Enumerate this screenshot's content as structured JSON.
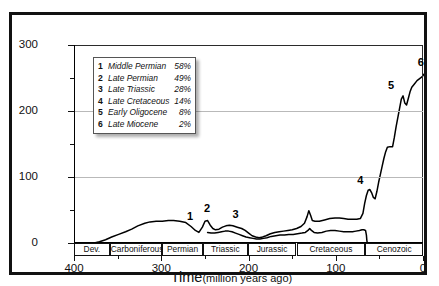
{
  "chart_data": {
    "type": "line",
    "title": "",
    "xlabel": "Time (million years ago)",
    "xlabel_main": "Time",
    "xlabel_sub": "(million years ago)",
    "ylabel": "Number of families",
    "xlim": [
      400,
      0
    ],
    "x_reversed": true,
    "ylim": [
      0,
      300
    ],
    "yticks": [
      0,
      100,
      200,
      300
    ],
    "yticks_minor": [
      50,
      150,
      250
    ],
    "xticks": [
      400,
      300,
      200,
      100,
      0
    ],
    "xticks_minor": [
      350,
      250,
      150,
      50
    ],
    "grid": "horizontal",
    "legend_position": "upper-left-inside",
    "series": [
      {
        "name": "Total families",
        "points": [
          [
            378,
            0
          ],
          [
            372,
            2
          ],
          [
            365,
            5
          ],
          [
            358,
            9
          ],
          [
            350,
            13
          ],
          [
            342,
            17
          ],
          [
            335,
            21
          ],
          [
            328,
            26
          ],
          [
            320,
            30
          ],
          [
            314,
            32
          ],
          [
            307,
            33
          ],
          [
            300,
            33
          ],
          [
            293,
            34
          ],
          [
            287,
            34
          ],
          [
            280,
            33
          ],
          [
            273,
            31
          ],
          [
            267,
            25
          ],
          [
            262,
            19
          ],
          [
            258,
            16
          ],
          [
            254,
            24
          ],
          [
            251,
            33
          ],
          [
            248,
            34
          ],
          [
            245,
            27
          ],
          [
            242,
            22
          ],
          [
            239,
            20
          ],
          [
            235,
            21
          ],
          [
            231,
            24
          ],
          [
            227,
            26
          ],
          [
            223,
            27
          ],
          [
            219,
            26
          ],
          [
            214,
            24
          ],
          [
            209,
            22
          ],
          [
            205,
            19
          ],
          [
            201,
            15
          ],
          [
            197,
            11
          ],
          [
            193,
            9
          ],
          [
            189,
            8
          ],
          [
            185,
            9
          ],
          [
            181,
            11
          ],
          [
            176,
            14
          ],
          [
            171,
            16
          ],
          [
            166,
            17
          ],
          [
            161,
            18
          ],
          [
            156,
            19
          ],
          [
            151,
            20
          ],
          [
            146,
            22
          ],
          [
            141,
            25
          ],
          [
            137,
            30
          ],
          [
            134,
            40
          ],
          [
            132,
            49
          ],
          [
            130,
            42
          ],
          [
            128,
            34
          ],
          [
            125,
            33
          ],
          [
            120,
            33
          ],
          [
            114,
            35
          ],
          [
            108,
            37
          ],
          [
            102,
            38
          ],
          [
            97,
            38
          ],
          [
            92,
            37
          ],
          [
            87,
            36
          ],
          [
            82,
            36
          ],
          [
            77,
            36
          ],
          [
            73,
            37
          ],
          [
            70,
            45
          ],
          [
            68,
            60
          ],
          [
            66,
            72
          ],
          [
            64,
            80
          ],
          [
            62,
            81
          ],
          [
            60,
            76
          ],
          [
            58,
            69
          ],
          [
            56,
            67
          ],
          [
            54,
            78
          ],
          [
            52,
            92
          ],
          [
            50,
            104
          ],
          [
            48,
            116
          ],
          [
            46,
            128
          ],
          [
            44,
            138
          ],
          [
            42,
            145
          ],
          [
            39,
            146
          ],
          [
            36,
            146
          ],
          [
            34,
            160
          ],
          [
            32,
            176
          ],
          [
            30,
            190
          ],
          [
            28,
            204
          ],
          [
            26,
            218
          ],
          [
            24,
            223
          ],
          [
            22,
            212
          ],
          [
            20,
            209
          ],
          [
            18,
            219
          ],
          [
            16,
            229
          ],
          [
            14,
            236
          ],
          [
            11,
            241
          ],
          [
            8,
            246
          ],
          [
            5,
            249
          ],
          [
            2,
            252
          ],
          [
            0,
            256
          ]
        ]
      },
      {
        "name": "Lower curve",
        "points": [
          [
            248,
            16
          ],
          [
            244,
            15
          ],
          [
            240,
            15
          ],
          [
            236,
            16
          ],
          [
            232,
            17
          ],
          [
            228,
            18
          ],
          [
            224,
            18
          ],
          [
            220,
            17
          ],
          [
            216,
            15
          ],
          [
            212,
            13
          ],
          [
            208,
            11
          ],
          [
            204,
            9
          ],
          [
            200,
            8
          ],
          [
            196,
            7
          ],
          [
            192,
            6
          ],
          [
            188,
            6
          ],
          [
            184,
            7
          ],
          [
            180,
            8
          ],
          [
            175,
            10
          ],
          [
            170,
            11
          ],
          [
            165,
            12
          ],
          [
            160,
            12
          ],
          [
            155,
            13
          ],
          [
            150,
            13
          ],
          [
            145,
            14
          ],
          [
            140,
            15
          ],
          [
            136,
            16
          ],
          [
            133,
            19
          ],
          [
            131,
            22
          ],
          [
            129,
            19
          ],
          [
            126,
            16
          ],
          [
            122,
            15
          ],
          [
            117,
            16
          ],
          [
            112,
            18
          ],
          [
            107,
            19
          ],
          [
            102,
            19
          ],
          [
            97,
            18
          ],
          [
            92,
            17
          ],
          [
            87,
            17
          ],
          [
            82,
            17
          ],
          [
            78,
            18
          ],
          [
            74,
            19
          ],
          [
            71,
            20
          ],
          [
            69,
            20
          ],
          [
            67,
            19
          ],
          [
            66,
            12
          ],
          [
            65.5,
            4
          ],
          [
            65,
            0
          ]
        ]
      }
    ],
    "events": [
      {
        "id": "1",
        "label": "Middle Permian",
        "pct": "58%",
        "time": 267,
        "families": 25
      },
      {
        "id": "2",
        "label": "Late Permian",
        "pct": "49%",
        "time": 251,
        "families": 33
      },
      {
        "id": "3",
        "label": "Late Triassic",
        "pct": "28%",
        "time": 216,
        "families": 27
      },
      {
        "id": "4",
        "label": "Late Cretaceous",
        "pct": "14%",
        "time": 65,
        "families": 80
      },
      {
        "id": "5",
        "label": "Early Oligocene",
        "pct": "8%",
        "time": 31,
        "families": 223
      },
      {
        "id": "6",
        "label": "Late Miocene",
        "pct": "2%",
        "time": 6,
        "families": 256
      }
    ],
    "periods": [
      {
        "name": "Dev.",
        "start": 400,
        "end": 359
      },
      {
        "name": "Carboniferous",
        "start": 359,
        "end": 299
      },
      {
        "name": "Permian",
        "start": 299,
        "end": 252
      },
      {
        "name": "Triassic",
        "start": 252,
        "end": 201
      },
      {
        "name": "Jurassic",
        "start": 201,
        "end": 145
      },
      {
        "name": "Cretaceous",
        "start": 145,
        "end": 66
      },
      {
        "name": "Cenozoic",
        "start": 66,
        "end": 0
      }
    ]
  },
  "colors": {
    "frame": "#111111",
    "curve": "#000000",
    "grid": "#b9b9b9",
    "axis": "#000000",
    "legend_bg": "#ffffff",
    "legend_border": "#555555"
  }
}
